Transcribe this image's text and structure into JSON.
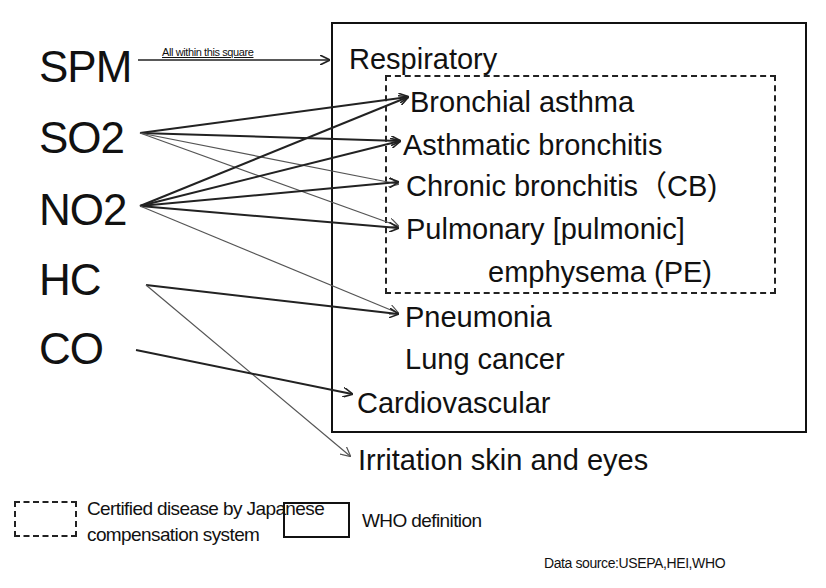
{
  "pollutants": [
    {
      "label": "SPM"
    },
    {
      "label": "SO2"
    },
    {
      "label": "NO2"
    },
    {
      "label": "HC"
    },
    {
      "label": "CO"
    }
  ],
  "spm_note": "All within this square",
  "who_box": {
    "title": "Respiratory"
  },
  "certified_diseases": [
    {
      "label": "Bronchial asthma"
    },
    {
      "label": "Asthmatic bronchitis"
    },
    {
      "label": "Chronic bronchitis（CB)"
    },
    {
      "label": "Pulmonary [pulmonic]"
    },
    {
      "label": "emphysema (PE)"
    }
  ],
  "other_diseases": [
    {
      "label": "Pneumonia"
    },
    {
      "label": "Lung cancer"
    },
    {
      "label": "Cardiovascular"
    }
  ],
  "outside_disease": {
    "label": "Irritation skin and eyes"
  },
  "links": [
    {
      "from": "SPM",
      "to": "Respiratory (all within this square)"
    },
    {
      "from": "SO2",
      "to": "Bronchial asthma"
    },
    {
      "from": "SO2",
      "to": "Asthmatic bronchitis"
    },
    {
      "from": "SO2",
      "to": "Chronic bronchitis"
    },
    {
      "from": "SO2",
      "to": "Pulmonary emphysema"
    },
    {
      "from": "NO2",
      "to": "Bronchial asthma"
    },
    {
      "from": "NO2",
      "to": "Asthmatic bronchitis"
    },
    {
      "from": "NO2",
      "to": "Chronic bronchitis"
    },
    {
      "from": "NO2",
      "to": "Pulmonary emphysema"
    },
    {
      "from": "NO2",
      "to": "Pneumonia"
    },
    {
      "from": "HC",
      "to": "Pneumonia"
    },
    {
      "from": "HC",
      "to": "Irritation skin and eyes"
    },
    {
      "from": "CO",
      "to": "Cardiovascular"
    }
  ],
  "legend": {
    "dashed_label_line1": "Certified disease by Japanese",
    "dashed_label_line2": "compensation system",
    "solid_label": "WHO definition"
  },
  "source": "Data source:USEPA,HEI,WHO",
  "colors": {
    "line": "#222222",
    "thin_line": "#555555",
    "background": "#ffffff"
  }
}
